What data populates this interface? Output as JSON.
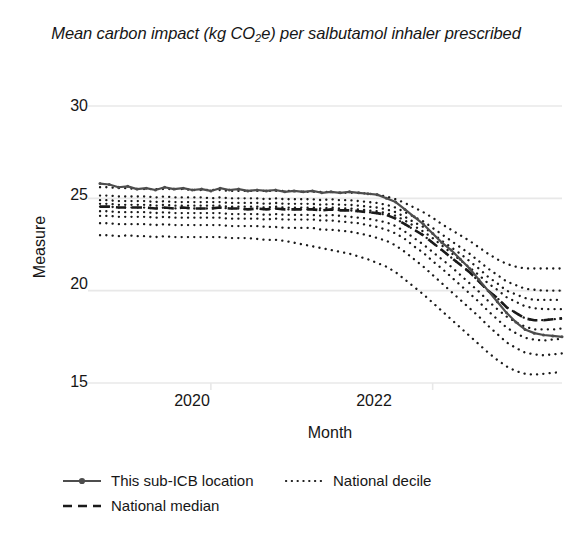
{
  "title": {
    "prefix": "Mean carbon impact (kg CO",
    "sub": "2",
    "suffix": "e) per salbutamol inhaler prescribed"
  },
  "axes": {
    "ylabel": "Measure",
    "xlabel": "Month",
    "yticks": [
      "30",
      "25",
      "20",
      "15"
    ],
    "xticks": [
      "2020",
      "2022"
    ],
    "ylim": [
      14.0,
      31.0
    ],
    "xlim": [
      "2019-01",
      "2023-04"
    ],
    "grid": "horizontal"
  },
  "legend": {
    "position": "below-left",
    "items": [
      {
        "label": "This sub-ICB location",
        "style": "solid-marker",
        "color": "#4d4d4d"
      },
      {
        "label": "National decile",
        "style": "dotted",
        "color": "#1a1a1a"
      },
      {
        "label": "National median",
        "style": "dashed",
        "color": "#1a1a1a"
      }
    ]
  },
  "colors": {
    "line": "#4d4d4d",
    "median": "#1a1a1a",
    "decile": "#1a1a1a",
    "grid": "#e8e8e8",
    "text": "#161616",
    "background": "#ffffff"
  },
  "chart_data": {
    "type": "line",
    "title": "Mean carbon impact (kg CO2e) per salbutamol inhaler prescribed",
    "xlabel": "Month",
    "ylabel": "Measure",
    "ylim": [
      14.0,
      31.0
    ],
    "grid": true,
    "legend_position": "below",
    "x": [
      "2019-01",
      "2019-02",
      "2019-03",
      "2019-04",
      "2019-05",
      "2019-06",
      "2019-07",
      "2019-08",
      "2019-09",
      "2019-10",
      "2019-11",
      "2019-12",
      "2020-01",
      "2020-02",
      "2020-03",
      "2020-04",
      "2020-05",
      "2020-06",
      "2020-07",
      "2020-08",
      "2020-09",
      "2020-10",
      "2020-11",
      "2020-12",
      "2021-01",
      "2021-02",
      "2021-03",
      "2021-04",
      "2021-05",
      "2021-06",
      "2021-07",
      "2021-08",
      "2021-09",
      "2021-10",
      "2021-11",
      "2021-12",
      "2022-01",
      "2022-02",
      "2022-03",
      "2022-04",
      "2022-05",
      "2022-06",
      "2022-07",
      "2022-08",
      "2022-09",
      "2022-10",
      "2022-11",
      "2022-12",
      "2023-01",
      "2023-02",
      "2023-03"
    ],
    "series": [
      {
        "name": "This sub-ICB location",
        "style": "solid-marker",
        "values": [
          25.8,
          25.75,
          25.6,
          25.65,
          25.5,
          25.55,
          25.45,
          25.6,
          25.5,
          25.55,
          25.45,
          25.5,
          25.4,
          25.55,
          25.45,
          25.5,
          25.4,
          25.45,
          25.4,
          25.45,
          25.35,
          25.4,
          25.35,
          25.4,
          25.3,
          25.35,
          25.3,
          25.35,
          25.3,
          25.25,
          25.2,
          25.0,
          24.8,
          24.4,
          24.0,
          23.6,
          23.1,
          22.6,
          22.2,
          21.7,
          21.2,
          20.6,
          20.0,
          19.4,
          18.8,
          18.3,
          17.9,
          17.7,
          17.6,
          17.55,
          17.5
        ]
      },
      {
        "name": "National median",
        "style": "dashed",
        "values": [
          24.55,
          24.55,
          24.5,
          24.5,
          24.5,
          24.5,
          24.45,
          24.5,
          24.45,
          24.5,
          24.45,
          24.45,
          24.45,
          24.5,
          24.45,
          24.45,
          24.4,
          24.45,
          24.4,
          24.45,
          24.4,
          24.4,
          24.4,
          24.4,
          24.35,
          24.4,
          24.35,
          24.35,
          24.3,
          24.25,
          24.2,
          24.1,
          23.9,
          23.6,
          23.3,
          23.0,
          22.6,
          22.2,
          21.8,
          21.4,
          21.0,
          20.5,
          20.0,
          19.6,
          19.1,
          18.8,
          18.5,
          18.4,
          18.4,
          18.45,
          18.5
        ]
      }
    ],
    "deciles": [
      {
        "name": "decile-90",
        "values": [
          25.6,
          25.6,
          25.55,
          25.55,
          25.5,
          25.5,
          25.5,
          25.5,
          25.5,
          25.5,
          25.45,
          25.45,
          25.45,
          25.45,
          25.4,
          25.4,
          25.4,
          25.4,
          25.4,
          25.4,
          25.4,
          25.4,
          25.35,
          25.35,
          25.35,
          25.35,
          25.3,
          25.3,
          25.3,
          25.25,
          25.2,
          25.1,
          24.95,
          24.75,
          24.5,
          24.25,
          23.95,
          23.6,
          23.3,
          23.0,
          22.7,
          22.35,
          22.0,
          21.7,
          21.45,
          21.3,
          21.2,
          21.2,
          21.2,
          21.2,
          21.2
        ]
      },
      {
        "name": "decile-80",
        "values": [
          25.15,
          25.15,
          25.1,
          25.1,
          25.1,
          25.1,
          25.05,
          25.1,
          25.05,
          25.05,
          25.05,
          25.05,
          25.0,
          25.05,
          25.0,
          25.0,
          25.0,
          25.0,
          24.95,
          25.0,
          24.95,
          24.95,
          24.95,
          24.95,
          24.9,
          24.95,
          24.9,
          24.9,
          24.85,
          24.8,
          24.75,
          24.65,
          24.5,
          24.25,
          24.0,
          23.75,
          23.4,
          23.05,
          22.7,
          22.35,
          22.0,
          21.6,
          21.2,
          20.85,
          20.5,
          20.3,
          20.1,
          20.05,
          20.0,
          20.0,
          20.0
        ]
      },
      {
        "name": "decile-70",
        "values": [
          24.9,
          24.9,
          24.85,
          24.85,
          24.85,
          24.85,
          24.8,
          24.85,
          24.8,
          24.8,
          24.8,
          24.8,
          24.8,
          24.8,
          24.75,
          24.75,
          24.75,
          24.75,
          24.7,
          24.75,
          24.7,
          24.7,
          24.7,
          24.7,
          24.65,
          24.7,
          24.65,
          24.65,
          24.6,
          24.55,
          24.5,
          24.4,
          24.25,
          24.0,
          23.7,
          23.45,
          23.1,
          22.7,
          22.35,
          22.0,
          21.6,
          21.2,
          20.75,
          20.4,
          20.0,
          19.8,
          19.6,
          19.5,
          19.5,
          19.5,
          19.5
        ]
      },
      {
        "name": "decile-60",
        "values": [
          24.7,
          24.7,
          24.65,
          24.65,
          24.65,
          24.65,
          24.6,
          24.65,
          24.6,
          24.6,
          24.6,
          24.6,
          24.6,
          24.6,
          24.55,
          24.55,
          24.55,
          24.55,
          24.5,
          24.55,
          24.5,
          24.5,
          24.5,
          24.5,
          24.45,
          24.5,
          24.45,
          24.45,
          24.4,
          24.35,
          24.3,
          24.2,
          24.05,
          23.8,
          23.5,
          23.2,
          22.85,
          22.45,
          22.05,
          21.65,
          21.25,
          20.85,
          20.4,
          20.05,
          19.65,
          19.4,
          19.15,
          19.05,
          19.0,
          19.0,
          19.0
        ]
      },
      {
        "name": "decile-50",
        "values": [
          24.55,
          24.55,
          24.5,
          24.5,
          24.5,
          24.5,
          24.45,
          24.5,
          24.45,
          24.5,
          24.45,
          24.45,
          24.45,
          24.5,
          24.45,
          24.45,
          24.4,
          24.45,
          24.4,
          24.45,
          24.4,
          24.4,
          24.4,
          24.4,
          24.35,
          24.4,
          24.35,
          24.35,
          24.3,
          24.25,
          24.2,
          24.1,
          23.9,
          23.6,
          23.3,
          23.0,
          22.6,
          22.2,
          21.8,
          21.4,
          21.0,
          20.5,
          20.0,
          19.6,
          19.1,
          18.8,
          18.5,
          18.4,
          18.4,
          18.45,
          18.5
        ]
      },
      {
        "name": "decile-40",
        "values": [
          24.3,
          24.3,
          24.25,
          24.25,
          24.25,
          24.25,
          24.2,
          24.25,
          24.2,
          24.2,
          24.2,
          24.2,
          24.2,
          24.2,
          24.15,
          24.15,
          24.15,
          24.15,
          24.1,
          24.15,
          24.1,
          24.1,
          24.1,
          24.1,
          24.05,
          24.1,
          24.05,
          24.0,
          23.95,
          23.9,
          23.8,
          23.7,
          23.5,
          23.2,
          22.85,
          22.5,
          22.1,
          21.7,
          21.3,
          20.85,
          20.4,
          19.95,
          19.45,
          19.0,
          18.6,
          18.3,
          18.05,
          17.9,
          17.9,
          17.9,
          17.95
        ]
      },
      {
        "name": "decile-30",
        "values": [
          24.05,
          24.05,
          24.0,
          24.0,
          24.0,
          24.0,
          23.95,
          24.0,
          23.95,
          23.95,
          23.95,
          23.95,
          23.95,
          23.95,
          23.9,
          23.9,
          23.9,
          23.9,
          23.85,
          23.9,
          23.85,
          23.85,
          23.85,
          23.85,
          23.8,
          23.8,
          23.75,
          23.7,
          23.65,
          23.55,
          23.45,
          23.3,
          23.1,
          22.8,
          22.4,
          22.05,
          21.6,
          21.2,
          20.75,
          20.3,
          19.85,
          19.4,
          18.9,
          18.45,
          18.0,
          17.7,
          17.45,
          17.35,
          17.3,
          17.35,
          17.4
        ]
      },
      {
        "name": "decile-20",
        "values": [
          23.65,
          23.65,
          23.6,
          23.6,
          23.6,
          23.6,
          23.55,
          23.6,
          23.55,
          23.55,
          23.55,
          23.55,
          23.55,
          23.55,
          23.5,
          23.5,
          23.5,
          23.5,
          23.45,
          23.45,
          23.4,
          23.4,
          23.4,
          23.4,
          23.3,
          23.3,
          23.25,
          23.2,
          23.1,
          23.0,
          22.85,
          22.7,
          22.45,
          22.1,
          21.7,
          21.3,
          20.85,
          20.4,
          19.95,
          19.5,
          19.05,
          18.6,
          18.1,
          17.65,
          17.2,
          16.9,
          16.65,
          16.55,
          16.5,
          16.55,
          16.6
        ]
      },
      {
        "name": "decile-10",
        "values": [
          23.0,
          23.0,
          22.95,
          23.0,
          22.95,
          22.95,
          22.9,
          22.95,
          22.9,
          22.9,
          22.9,
          22.9,
          22.9,
          22.9,
          22.85,
          22.85,
          22.85,
          22.8,
          22.75,
          22.75,
          22.7,
          22.6,
          22.5,
          22.4,
          22.3,
          22.2,
          22.1,
          22.0,
          21.85,
          21.7,
          21.5,
          21.3,
          21.0,
          20.6,
          20.2,
          19.8,
          19.35,
          18.9,
          18.45,
          18.0,
          17.55,
          17.1,
          16.65,
          16.25,
          15.9,
          15.65,
          15.5,
          15.45,
          15.5,
          15.55,
          15.6
        ]
      }
    ]
  }
}
